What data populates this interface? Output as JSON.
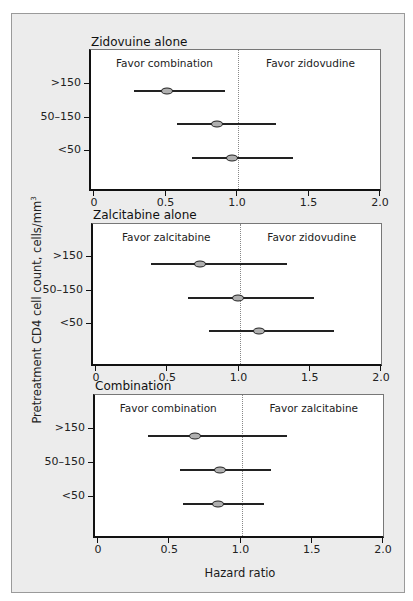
{
  "chart_data": [
    {
      "type": "forest",
      "title": "Zidovuine alone",
      "left_annotation": "Favor combination",
      "right_annotation": "Favor zidovudine",
      "categories": [
        ">150",
        "50–150",
        "<50"
      ],
      "series": [
        {
          "name": "Hazard ratio",
          "values": [
            0.52,
            0.87,
            0.97
          ]
        },
        {
          "name": "CI lower",
          "values": [
            0.29,
            0.59,
            0.69
          ]
        },
        {
          "name": "CI upper",
          "values": [
            0.92,
            1.28,
            1.4
          ]
        }
      ],
      "xlim": [
        0,
        2.0
      ],
      "xticks": [
        "0",
        "0.5",
        "1.0",
        "1.5",
        "2.0"
      ],
      "reference_line": 1.0
    },
    {
      "type": "forest",
      "title": "Zalcitabine alone",
      "left_annotation": "Favor zalcitabine",
      "right_annotation": "Favor zidovudine",
      "categories": [
        ">150",
        "50–150",
        "<50"
      ],
      "series": [
        {
          "name": "Hazard ratio",
          "values": [
            0.74,
            1.0,
            1.15
          ]
        },
        {
          "name": "CI lower",
          "values": [
            0.39,
            0.65,
            0.8
          ]
        },
        {
          "name": "CI upper",
          "values": [
            1.35,
            1.54,
            1.68
          ]
        }
      ],
      "xlim": [
        0,
        2.0
      ],
      "xticks": [
        "0",
        "0.5",
        "1.0",
        "1.5",
        "2.0"
      ],
      "reference_line": 1.0
    },
    {
      "type": "forest",
      "title": "Combination",
      "left_annotation": "Favor combination",
      "right_annotation": "Favor zalcitabine",
      "categories": [
        ">150",
        "50–150",
        "<50"
      ],
      "series": [
        {
          "name": "Hazard ratio",
          "values": [
            0.69,
            0.86,
            0.85
          ]
        },
        {
          "name": "CI lower",
          "values": [
            0.36,
            0.58,
            0.6
          ]
        },
        {
          "name": "CI upper",
          "values": [
            1.33,
            1.22,
            1.17
          ]
        }
      ],
      "xlim": [
        0,
        2.0
      ],
      "xticks": [
        "0",
        "0.5",
        "1.0",
        "1.5",
        "2.0"
      ],
      "reference_line": 1.0,
      "xlabel": "Hazard ratio"
    }
  ],
  "ylabel": "Pretreatment CD4 cell count, cells/mm",
  "ylabel_superscript": "3",
  "xlabel": "Hazard ratio",
  "panels": [
    {
      "title": "Zidovuine alone",
      "left": "Favor combination",
      "right": "Favor zidovudine",
      "yticks": [
        ">150",
        "50–150",
        "<50"
      ],
      "xticks": [
        "0",
        "0.5",
        "1.0",
        "1.5",
        "2.0"
      ]
    },
    {
      "title": "Zalcitabine alone",
      "left": "Favor zalcitabine",
      "right": "Favor zidovudine",
      "yticks": [
        ">150",
        "50–150",
        "<50"
      ],
      "xticks": [
        "0",
        "0.5",
        "1.0",
        "1.5",
        "2.0"
      ]
    },
    {
      "title": "Combination",
      "left": "Favor combination",
      "right": "Favor zalcitabine",
      "yticks": [
        ">150",
        "50–150",
        "<50"
      ],
      "xticks": [
        "0",
        "0.5",
        "1.0",
        "1.5",
        "2.0"
      ]
    }
  ],
  "colors": {
    "frame_bg": "#ececec",
    "plot_bg": "#ffffff",
    "marker_fill": "#b0b0b0",
    "line": "#222222"
  }
}
